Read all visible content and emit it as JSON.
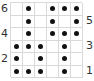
{
  "chart_data": {
    "type": "table",
    "rows": 6,
    "columns": 6,
    "row_labels_left": [
      "6",
      "4",
      "2"
    ],
    "row_labels_right": [
      "5",
      "3",
      "1"
    ],
    "grid_top_to_bottom": [
      {
        "row": 6,
        "cells": [
          0,
          1,
          0,
          1,
          1,
          1
        ]
      },
      {
        "row": 5,
        "cells": [
          0,
          1,
          0,
          1,
          0,
          1
        ]
      },
      {
        "row": 4,
        "cells": [
          0,
          1,
          0,
          1,
          1,
          1
        ]
      },
      {
        "row": 3,
        "cells": [
          1,
          1,
          1,
          0,
          1,
          0
        ]
      },
      {
        "row": 2,
        "cells": [
          1,
          0,
          1,
          0,
          1,
          0
        ]
      },
      {
        "row": 1,
        "cells": [
          1,
          1,
          1,
          0,
          1,
          0
        ]
      }
    ],
    "colors": {
      "dot": "#111111",
      "grid_line": "#d9d9d9",
      "background": "#ffffff",
      "label": "#333333"
    }
  },
  "labels": {
    "row6": "6",
    "row5": "5",
    "row4": "4",
    "row3": "3",
    "row2": "2",
    "row1": "1"
  }
}
